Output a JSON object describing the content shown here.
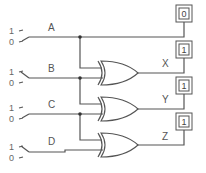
{
  "diagram": {
    "type": "logic-circuit",
    "inputs": [
      {
        "name": "A",
        "switch_labels": [
          "1",
          "0"
        ]
      },
      {
        "name": "B",
        "switch_labels": [
          "1",
          "0"
        ]
      },
      {
        "name": "C",
        "switch_labels": [
          "1",
          "0"
        ]
      },
      {
        "name": "D",
        "switch_labels": [
          "1",
          "0"
        ]
      }
    ],
    "gates": [
      {
        "type": "XOR",
        "inputs": [
          "A",
          "B"
        ],
        "output": "X"
      },
      {
        "type": "XOR",
        "inputs": [
          "B",
          "C"
        ],
        "output": "Y"
      },
      {
        "type": "XOR",
        "inputs": [
          "C",
          "D"
        ],
        "output": "Z"
      }
    ],
    "outputs": [
      {
        "name": "A",
        "value": "0"
      },
      {
        "name": "X",
        "value": "1"
      },
      {
        "name": "Y",
        "value": "1"
      },
      {
        "name": "Z",
        "value": "1"
      }
    ]
  }
}
